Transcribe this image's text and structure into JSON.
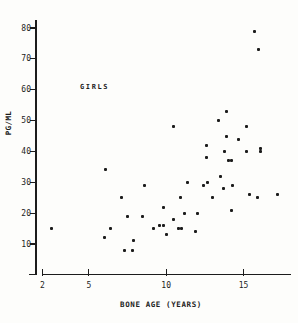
{
  "chart_data": {
    "type": "scatter",
    "title": "",
    "annotation": "GIRLS",
    "xlabel": "BONE AGE (YEARS)",
    "ylabel": "PG/ML",
    "x_ticks": [
      2,
      5,
      10,
      15
    ],
    "y_ticks": [
      10,
      20,
      30,
      40,
      50,
      60,
      70,
      80
    ],
    "xlim": [
      2,
      18.1
    ],
    "ylim": [
      0,
      80
    ],
    "grid": false,
    "legend": "none",
    "marker": "small black square",
    "colors": {
      "ink": "#1c1c1c",
      "paper": "#fdfdfb"
    },
    "points": [
      [
        2.6,
        15
      ],
      [
        6.0,
        12
      ],
      [
        6.1,
        34
      ],
      [
        6.4,
        15
      ],
      [
        7.1,
        25
      ],
      [
        7.3,
        8
      ],
      [
        7.5,
        19
      ],
      [
        7.8,
        8
      ],
      [
        7.9,
        11
      ],
      [
        8.5,
        19
      ],
      [
        8.6,
        29
      ],
      [
        9.2,
        15
      ],
      [
        9.6,
        16
      ],
      [
        9.8,
        16
      ],
      [
        9.8,
        22
      ],
      [
        10.0,
        13
      ],
      [
        10.5,
        18
      ],
      [
        10.5,
        48
      ],
      [
        10.8,
        15
      ],
      [
        10.9,
        25
      ],
      [
        11.0,
        15
      ],
      [
        11.2,
        20
      ],
      [
        11.4,
        30
      ],
      [
        11.9,
        14
      ],
      [
        12.0,
        20
      ],
      [
        12.4,
        29
      ],
      [
        12.6,
        38
      ],
      [
        12.6,
        42
      ],
      [
        12.7,
        30
      ],
      [
        13.0,
        25
      ],
      [
        13.4,
        50
      ],
      [
        13.5,
        32
      ],
      [
        13.7,
        28
      ],
      [
        13.8,
        40
      ],
      [
        13.9,
        45
      ],
      [
        13.9,
        53
      ],
      [
        14.0,
        37
      ],
      [
        14.2,
        21
      ],
      [
        14.2,
        37
      ],
      [
        14.3,
        29
      ],
      [
        14.7,
        44
      ],
      [
        15.2,
        40
      ],
      [
        15.2,
        48
      ],
      [
        15.4,
        26
      ],
      [
        15.7,
        79
      ],
      [
        15.9,
        25
      ],
      [
        16.0,
        73
      ],
      [
        16.1,
        40
      ],
      [
        16.1,
        41
      ],
      [
        17.2,
        26
      ]
    ]
  }
}
